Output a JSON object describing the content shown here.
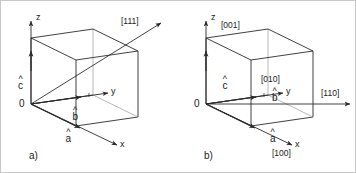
{
  "figure": {
    "type": "crystallographic-unit-cell-diagram",
    "background_color": "#ffffff",
    "line_color": "#2b2b2b",
    "faint_line_color": "#b0b0b0",
    "text_color": "#1a1a1a",
    "panel_count": 2
  },
  "panels": [
    {
      "id": "a",
      "caption": "a)",
      "origin_label": "0",
      "axes": [
        {
          "name": "z-axis",
          "label": "z"
        },
        {
          "name": "y-axis",
          "label": "y"
        },
        {
          "name": "x-axis",
          "label": "x"
        }
      ],
      "lattice_vectors": [
        {
          "name": "a-vector",
          "letter": "a",
          "hat": "^"
        },
        {
          "name": "b-vector",
          "letter": "b",
          "hat": "^"
        },
        {
          "name": "c-vector",
          "letter": "c",
          "hat": "^"
        }
      ],
      "directions": [
        {
          "name": "direction-111",
          "label": "[111]"
        }
      ]
    },
    {
      "id": "b",
      "caption": "b)",
      "origin_label": "0",
      "axes": [
        {
          "name": "z-axis",
          "label": "z"
        },
        {
          "name": "y-axis",
          "label": "y"
        },
        {
          "name": "x-axis",
          "label": "x"
        }
      ],
      "lattice_vectors": [
        {
          "name": "a-vector",
          "letter": "a",
          "hat": "^"
        },
        {
          "name": "b-vector",
          "letter": "b",
          "hat": "^"
        },
        {
          "name": "c-vector",
          "letter": "c",
          "hat": "^"
        }
      ],
      "directions": [
        {
          "name": "direction-001",
          "label": "[001]"
        },
        {
          "name": "direction-010",
          "label": "[010]"
        },
        {
          "name": "direction-100",
          "label": "[100]"
        },
        {
          "name": "direction-110",
          "label": "[110]"
        }
      ]
    }
  ]
}
